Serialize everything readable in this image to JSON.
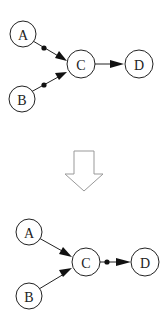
{
  "diagram": {
    "top": {
      "nodes": [
        {
          "id": "A",
          "label": "A"
        },
        {
          "id": "B",
          "label": "B"
        },
        {
          "id": "C",
          "label": "C"
        },
        {
          "id": "D",
          "label": "D"
        }
      ],
      "edges": [
        {
          "from": "A",
          "to": "C",
          "marker": "dot-on-edge"
        },
        {
          "from": "B",
          "to": "C",
          "marker": "dot-on-edge"
        },
        {
          "from": "C",
          "to": "D",
          "marker": "none"
        }
      ]
    },
    "transform_arrow": {
      "direction": "down",
      "color": "#999999"
    },
    "bottom": {
      "nodes": [
        {
          "id": "A",
          "label": "A"
        },
        {
          "id": "B",
          "label": "B"
        },
        {
          "id": "C",
          "label": "C"
        },
        {
          "id": "D",
          "label": "D"
        }
      ],
      "edges": [
        {
          "from": "A",
          "to": "C",
          "marker": "none"
        },
        {
          "from": "B",
          "to": "C",
          "marker": "none"
        },
        {
          "from": "C",
          "to": "D",
          "marker": "dot-on-edge"
        }
      ]
    }
  }
}
